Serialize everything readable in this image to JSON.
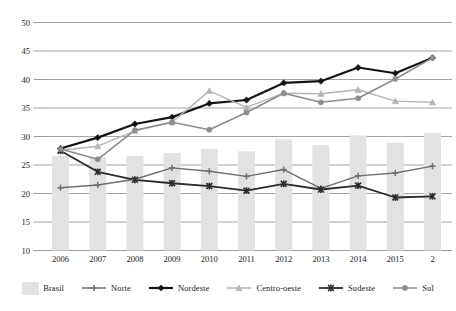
{
  "chart_data": {
    "type": "line",
    "title": "",
    "subtitle": "",
    "xlabel": "",
    "ylabel": "",
    "ylim": [
      10,
      50
    ],
    "yticks": [
      10,
      15,
      20,
      25,
      30,
      35,
      40,
      45,
      50
    ],
    "grid": true,
    "legend_position": "bottom",
    "categories": [
      "2006",
      "2007",
      "2008",
      "2009",
      "2010",
      "2011",
      "2012",
      "2013",
      "2014",
      "2015",
      "2016"
    ],
    "xtick_labels": [
      "2006",
      "2007",
      "2008",
      "2009",
      "2010",
      "2011",
      "2012",
      "2013",
      "2014",
      "2015",
      "2"
    ],
    "bar_series": {
      "name": "Brasil",
      "type": "bar",
      "color": "#e2e2e2",
      "values": [
        26.6,
        26.3,
        26.6,
        27.1,
        27.8,
        27.4,
        29.5,
        28.5,
        30.2,
        28.9,
        30.6
      ]
    },
    "series": [
      {
        "name": "Norte",
        "color": "#6e6e6e",
        "marker": "plus",
        "width": 1.4,
        "values": [
          21.0,
          21.5,
          22.5,
          24.5,
          23.9,
          23.0,
          24.2,
          20.9,
          23.1,
          23.6,
          24.8
        ]
      },
      {
        "name": "Nordeste",
        "color": "#141414",
        "marker": "diamond",
        "width": 2.2,
        "values": [
          27.9,
          29.8,
          32.2,
          33.4,
          35.8,
          36.4,
          39.4,
          39.7,
          42.1,
          41.1,
          43.8
        ]
      },
      {
        "name": "Centro-oeste",
        "color": "#b4b4b4",
        "marker": "triangle",
        "width": 1.4,
        "values": [
          27.6,
          28.3,
          31.0,
          32.5,
          38.0,
          35.1,
          37.6,
          37.5,
          38.2,
          36.2,
          36.0
        ]
      },
      {
        "name": "Sudeste",
        "color": "#2b2b2b",
        "marker": "star",
        "width": 1.8,
        "values": [
          27.5,
          23.8,
          22.4,
          21.8,
          21.3,
          20.5,
          21.7,
          20.7,
          21.4,
          19.3,
          19.5
        ]
      },
      {
        "name": "Sul",
        "color": "#8c8c8c",
        "marker": "dot",
        "width": 1.6,
        "values": [
          27.8,
          26.0,
          31.1,
          32.5,
          31.2,
          34.2,
          37.6,
          36.0,
          36.7,
          40.1,
          43.8
        ]
      }
    ]
  },
  "legend": {
    "items": [
      {
        "label": "Brasil",
        "kind": "bar",
        "color": "#e2e2e2"
      },
      {
        "label": "Norte",
        "kind": "line",
        "color": "#6e6e6e",
        "marker": "plus"
      },
      {
        "label": "Nordeste",
        "kind": "line",
        "color": "#141414",
        "marker": "diamond"
      },
      {
        "label": "Centro-oeste",
        "kind": "line",
        "color": "#b4b4b4",
        "marker": "triangle"
      },
      {
        "label": "Sudeste",
        "kind": "line",
        "color": "#2b2b2b",
        "marker": "star"
      },
      {
        "label": "Sul",
        "kind": "line",
        "color": "#8c8c8c",
        "marker": "dot"
      }
    ]
  },
  "style": {
    "grid_color": "#9a9a9a",
    "background": "#ffffff",
    "text_color": "#1a1a1a"
  }
}
